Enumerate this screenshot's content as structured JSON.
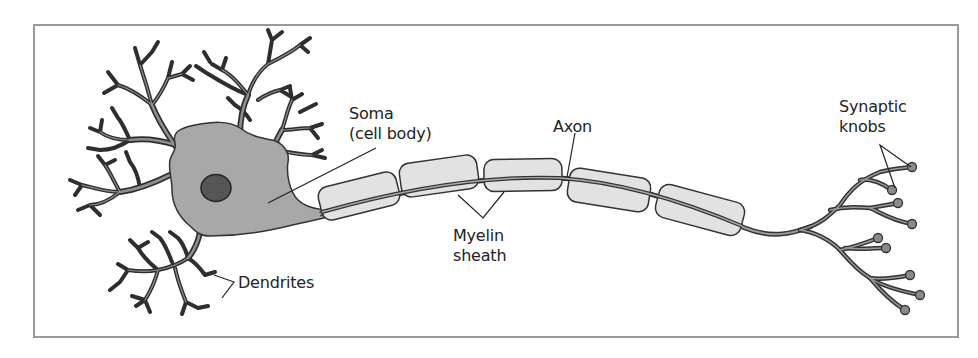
{
  "diagram": {
    "colors": {
      "frame": "#9a9a9a",
      "outline": "#333333",
      "soma_fill": "#a9a9a9",
      "nucleus_fill": "#555555",
      "myelin_fill": "#e2e2e2",
      "dendrite_fill": "#8c8c8c",
      "text": "#222222"
    },
    "labels": {
      "soma_line1": "Soma",
      "soma_line2": "(cell body)",
      "axon": "Axon",
      "myelin_line1": "Myelin",
      "myelin_line2": "sheath",
      "dendrites": "Dendrites",
      "synaptic_line1": "Synaptic",
      "synaptic_line2": "knobs"
    },
    "myelin_segments": 5,
    "synaptic_knobs": 9
  }
}
